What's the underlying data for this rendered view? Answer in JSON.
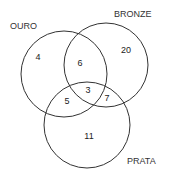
{
  "diagram": {
    "type": "venn-3",
    "sets": [
      {
        "name": "OURO",
        "only": "4"
      },
      {
        "name": "BRONZE",
        "only": "20"
      },
      {
        "name": "PRATA",
        "only": "11"
      }
    ],
    "intersections": {
      "ouro_bronze": "6",
      "ouro_prata": "5",
      "bronze_prata": "7",
      "all": "3"
    },
    "stroke_color": "#333333"
  }
}
